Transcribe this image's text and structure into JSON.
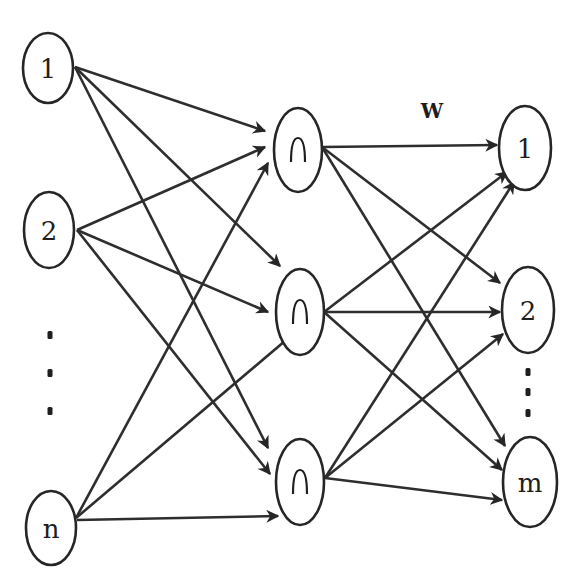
{
  "diagram": {
    "type": "neural-network",
    "title": "",
    "weight_label": {
      "text": "W",
      "x": 432,
      "y": 118
    },
    "colors": {
      "stroke": "#262626",
      "text": "#1e1e1e",
      "background": "#ffffff"
    },
    "layers": [
      {
        "name": "input",
        "nodes": [
          {
            "id": "in-1",
            "label": "1",
            "cx": 48,
            "cy": 68,
            "rx": 25,
            "ry": 35
          },
          {
            "id": "in-2",
            "label": "2",
            "cx": 49,
            "cy": 230,
            "rx": 25,
            "ry": 38
          },
          {
            "id": "in-n",
            "label": "n",
            "cx": 51,
            "cy": 528,
            "rx": 25,
            "ry": 37
          }
        ],
        "ellipsis": {
          "x": 50,
          "ys": [
            335,
            373,
            411
          ]
        }
      },
      {
        "name": "hidden",
        "activation_symbol": "gaussian-bump",
        "nodes": [
          {
            "id": "hid-1",
            "label": "",
            "cx": 298,
            "cy": 150,
            "rx": 24,
            "ry": 42
          },
          {
            "id": "hid-2",
            "label": "",
            "cx": 300,
            "cy": 312,
            "rx": 24,
            "ry": 43
          },
          {
            "id": "hid-3",
            "label": "",
            "cx": 300,
            "cy": 482,
            "rx": 24,
            "ry": 43
          }
        ]
      },
      {
        "name": "output",
        "nodes": [
          {
            "id": "out-1",
            "label": "1",
            "cx": 525,
            "cy": 148,
            "rx": 26,
            "ry": 42
          },
          {
            "id": "out-2",
            "label": "2",
            "cx": 528,
            "cy": 310,
            "rx": 26,
            "ry": 43
          },
          {
            "id": "out-m",
            "label": "m",
            "cx": 530,
            "cy": 482,
            "rx": 27,
            "ry": 45
          }
        ],
        "ellipsis": {
          "x": 528,
          "ys": [
            372,
            392,
            413
          ]
        }
      }
    ],
    "edges": [
      {
        "from": [
          75,
          67
        ],
        "to": [
          265,
          131
        ]
      },
      {
        "from": [
          75,
          67
        ],
        "to": [
          280,
          266
        ]
      },
      {
        "from": [
          75,
          67
        ],
        "to": [
          268,
          448
        ]
      },
      {
        "from": [
          77,
          230
        ],
        "to": [
          265,
          147
        ]
      },
      {
        "from": [
          77,
          230
        ],
        "to": [
          268,
          312
        ]
      },
      {
        "from": [
          77,
          230
        ],
        "to": [
          270,
          474
        ]
      },
      {
        "from": [
          76,
          518
        ],
        "to": [
          268,
          163
        ]
      },
      {
        "from": [
          76,
          518
        ],
        "to": [
          292,
          335
        ]
      },
      {
        "from": [
          77,
          520
        ],
        "to": [
          278,
          516
        ]
      },
      {
        "from": [
          322,
          147
        ],
        "to": [
          497,
          145
        ]
      },
      {
        "from": [
          322,
          147
        ],
        "to": [
          500,
          283
        ]
      },
      {
        "from": [
          322,
          147
        ],
        "to": [
          505,
          446
        ]
      },
      {
        "from": [
          324,
          312
        ],
        "to": [
          507,
          172
        ]
      },
      {
        "from": [
          324,
          312
        ],
        "to": [
          500,
          312
        ]
      },
      {
        "from": [
          324,
          312
        ],
        "to": [
          502,
          470
        ]
      },
      {
        "from": [
          325,
          478
        ],
        "to": [
          514,
          182
        ]
      },
      {
        "from": [
          325,
          478
        ],
        "to": [
          503,
          334
        ]
      },
      {
        "from": [
          325,
          478
        ],
        "to": [
          502,
          500
        ]
      }
    ]
  }
}
